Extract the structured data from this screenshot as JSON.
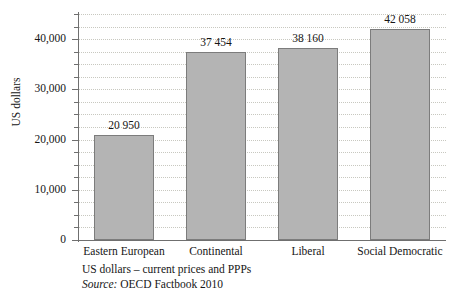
{
  "chart_data": {
    "type": "bar",
    "title": "",
    "categories": [
      "Eastern European",
      "Continental",
      "Liberal",
      "Social Democratic"
    ],
    "values": [
      20950,
      37454,
      38160,
      42058
    ],
    "value_labels": [
      "20 950",
      "37 454",
      "38 160",
      "42 058"
    ],
    "xlabel": "",
    "ylabel": "US dollars",
    "ylim": [
      0,
      45000
    ],
    "ytick_values": [
      0,
      10000,
      20000,
      30000,
      40000
    ],
    "ytick_labels": [
      "0",
      "10,000",
      "20,000",
      "30,000",
      "40,000"
    ],
    "minor_tick_step": 2500,
    "grid": "horizontal-dotted",
    "legend": "none",
    "bar_fill": "#b4b4b4",
    "bar_edge": "#7c7c7c",
    "axis_color": "#6f6f6f",
    "grid_color": "#c8c8c0"
  },
  "caption": {
    "line1": "US dollars – current prices and PPPs",
    "source_word": "Source:",
    "source_text": " OECD Factbook 2010"
  }
}
